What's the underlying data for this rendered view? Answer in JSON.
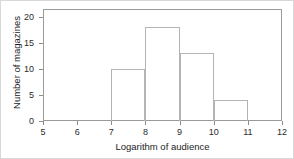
{
  "chart_data": {
    "type": "bar",
    "title": "",
    "subtitle": "",
    "xlabel": "Logarithm of audience",
    "ylabel": "Number of magazines",
    "xlim": [
      5,
      12
    ],
    "ylim": [
      0,
      21.5
    ],
    "xticks": [
      "5",
      "6",
      "7",
      "8",
      "9",
      "10",
      "11",
      "12"
    ],
    "xtick_values": [
      5,
      6,
      7,
      8,
      9,
      10,
      11,
      12
    ],
    "yticks": [
      "0",
      "5",
      "10",
      "15",
      "20"
    ],
    "ytick_values": [
      0,
      5,
      10,
      15,
      20
    ],
    "grid": false,
    "legend": null,
    "bin_width": 1,
    "bins": [
      {
        "x0": 5,
        "x1": 6,
        "value": 0
      },
      {
        "x0": 6,
        "x1": 7,
        "value": 0
      },
      {
        "x0": 7,
        "x1": 8,
        "value": 10
      },
      {
        "x0": 8,
        "x1": 9,
        "value": 18
      },
      {
        "x0": 9,
        "x1": 10,
        "value": 13
      },
      {
        "x0": 10,
        "x1": 11,
        "value": 4
      },
      {
        "x0": 11,
        "x1": 12,
        "value": 0
      }
    ],
    "categories": [
      "5-6",
      "6-7",
      "7-8",
      "8-9",
      "9-10",
      "10-11",
      "11-12"
    ],
    "values": [
      0,
      0,
      10,
      18,
      13,
      4,
      0
    ],
    "colors": {
      "bar_edge": "#b4b4b4",
      "bar_fill": "transparent",
      "frame": "#9a9a9a",
      "tick": "#8c8c8c",
      "text": "#1c1c1c",
      "background": "#ffffff"
    }
  }
}
